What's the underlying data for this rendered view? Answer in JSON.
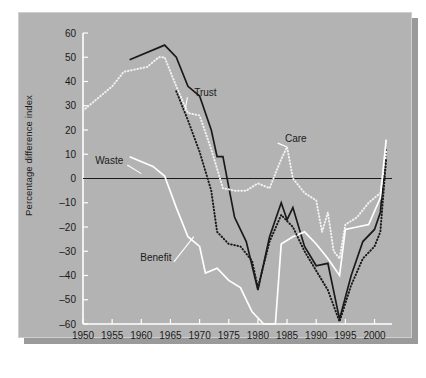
{
  "chart_data": {
    "type": "line",
    "title": "",
    "xlabel": "",
    "ylabel": "Percentage difference index",
    "xlim": [
      1950,
      2003
    ],
    "ylim": [
      -60,
      60
    ],
    "ytick_step": 10,
    "xtick_step": 5,
    "grid": false,
    "zero_line": true,
    "legend_position": "inline-annotations",
    "xticks": [
      "1950",
      "1955",
      "1960",
      "1965",
      "1970",
      "1975",
      "1980",
      "1985",
      "1990",
      "1995",
      "2000"
    ],
    "yticks": [
      "60",
      "50",
      "40",
      "30",
      "20",
      "10",
      "0",
      "-10",
      "-20",
      "-30",
      "-40",
      "-50",
      "-60"
    ],
    "series": [
      {
        "name": "Trust",
        "style": "solid",
        "color": "#1a1a1a",
        "label": "Trust",
        "label_x": 1971.0,
        "label_y": 34.0,
        "leader_to_x": 1967.5,
        "leader_to_y": 28.0,
        "points": [
          [
            1958,
            49
          ],
          [
            1964,
            55
          ],
          [
            1966,
            50
          ],
          [
            1968,
            38
          ],
          [
            1970,
            34
          ],
          [
            1972,
            20
          ],
          [
            1973,
            9
          ],
          [
            1974,
            9
          ],
          [
            1976,
            -16
          ],
          [
            1978,
            -26
          ],
          [
            1980,
            -46
          ],
          [
            1982,
            -24
          ],
          [
            1984,
            -10
          ],
          [
            1985,
            -17
          ],
          [
            1986,
            -12
          ],
          [
            1988,
            -28
          ],
          [
            1990,
            -36
          ],
          [
            1992,
            -35
          ],
          [
            1994,
            -58
          ],
          [
            1996,
            -40
          ],
          [
            1998,
            -26
          ],
          [
            2000,
            -21
          ],
          [
            2001,
            -14
          ],
          [
            2002,
            12
          ]
        ]
      },
      {
        "name": "Care",
        "style": "dotted",
        "color": "#f2f2f2",
        "label": "Care",
        "label_x": 1986.5,
        "label_y": 15.0,
        "leader_to_x": 1985.0,
        "leader_to_y": 13.0,
        "points": [
          [
            1950,
            28
          ],
          [
            1955,
            38
          ],
          [
            1957,
            44
          ],
          [
            1959,
            45
          ],
          [
            1961,
            46
          ],
          [
            1963,
            50
          ],
          [
            1964,
            50
          ],
          [
            1966,
            38
          ],
          [
            1968,
            27
          ],
          [
            1970,
            26
          ],
          [
            1972,
            12
          ],
          [
            1974,
            -4
          ],
          [
            1976,
            -5
          ],
          [
            1978,
            -5
          ],
          [
            1980,
            -2
          ],
          [
            1982,
            -4
          ],
          [
            1984,
            8
          ],
          [
            1985,
            13
          ],
          [
            1986,
            0
          ],
          [
            1988,
            -6
          ],
          [
            1990,
            -9
          ],
          [
            1991,
            -22
          ],
          [
            1992,
            -14
          ],
          [
            1993,
            -30
          ],
          [
            1994,
            -33
          ],
          [
            1995,
            -19
          ],
          [
            1997,
            -16
          ],
          [
            1999,
            -10
          ],
          [
            2001,
            -6
          ],
          [
            2002,
            11
          ]
        ]
      },
      {
        "name": "Waste",
        "style": "solid",
        "color": "#ffffff",
        "label": "Waste",
        "label_x": 1954.5,
        "label_y": 6.0,
        "leader_to_x": 1960.0,
        "leader_to_y": 2.0,
        "points": [
          [
            1958,
            9
          ],
          [
            1962,
            5
          ],
          [
            1964,
            1
          ],
          [
            1966,
            -12
          ],
          [
            1968,
            -24
          ],
          [
            1970,
            -28
          ],
          [
            1971,
            -39
          ],
          [
            1973,
            -37
          ],
          [
            1975,
            -42
          ],
          [
            1977,
            -45
          ],
          [
            1979,
            -55
          ],
          [
            1981,
            -60
          ],
          [
            1983,
            -60
          ],
          [
            1984,
            -27
          ],
          [
            1986,
            -24
          ],
          [
            1988,
            -22
          ],
          [
            1990,
            -27
          ],
          [
            1992,
            -33
          ],
          [
            1994,
            -40
          ],
          [
            1995,
            -21
          ],
          [
            1997,
            -20
          ],
          [
            1999,
            -19
          ],
          [
            2001,
            -8
          ],
          [
            2002,
            16
          ]
        ]
      },
      {
        "name": "Benefit",
        "style": "dotted",
        "color": "#1a1a1a",
        "label": "Benefit",
        "label_x": 1962.5,
        "label_y": -34.0,
        "leader_to_x": 1969.0,
        "leader_to_y": -24.0,
        "points": [
          [
            1966,
            36
          ],
          [
            1968,
            24
          ],
          [
            1970,
            11
          ],
          [
            1972,
            -5
          ],
          [
            1973,
            -22
          ],
          [
            1975,
            -27
          ],
          [
            1977,
            -28
          ],
          [
            1979,
            -34
          ],
          [
            1980,
            -45
          ],
          [
            1982,
            -26
          ],
          [
            1984,
            -15
          ],
          [
            1986,
            -20
          ],
          [
            1988,
            -30
          ],
          [
            1990,
            -38
          ],
          [
            1992,
            -46
          ],
          [
            1994,
            -59
          ],
          [
            1996,
            -44
          ],
          [
            1998,
            -33
          ],
          [
            2000,
            -28
          ],
          [
            2001,
            -22
          ],
          [
            2002,
            8
          ]
        ]
      }
    ]
  },
  "colors": {
    "panel_background": "#b3b3b3",
    "page_background": "#ffffff",
    "shadow": "#9a9a9a",
    "axis": "#ffffff",
    "zero_line": "#1a1a1a",
    "text": "#1a1a1a"
  }
}
